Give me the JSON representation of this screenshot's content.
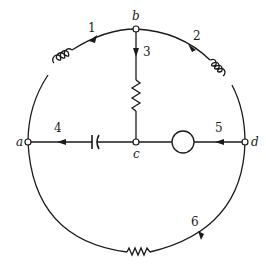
{
  "diagram": {
    "type": "circuit-graph",
    "nodes": [
      {
        "id": "a",
        "label": "a"
      },
      {
        "id": "b",
        "label": "b"
      },
      {
        "id": "c",
        "label": "c"
      },
      {
        "id": "d",
        "label": "d"
      }
    ],
    "branches": [
      {
        "number": "1",
        "label": "1",
        "from": "b",
        "to": "a",
        "element": "inductor"
      },
      {
        "number": "2",
        "label": "2",
        "from": "b",
        "to": "d",
        "element": "inductor"
      },
      {
        "number": "3",
        "label": "3",
        "from": "b",
        "to": "c",
        "element": "resistor"
      },
      {
        "number": "4",
        "label": "4",
        "from": "c",
        "to": "a",
        "element": "capacitor"
      },
      {
        "number": "5",
        "label": "5",
        "from": "d",
        "to": "c",
        "element": "source"
      },
      {
        "number": "6",
        "label": "6",
        "from": "d",
        "to": "a",
        "element": "resistor"
      }
    ],
    "colors": {
      "line": "#1a1a1a",
      "background": "#ffffff"
    }
  }
}
